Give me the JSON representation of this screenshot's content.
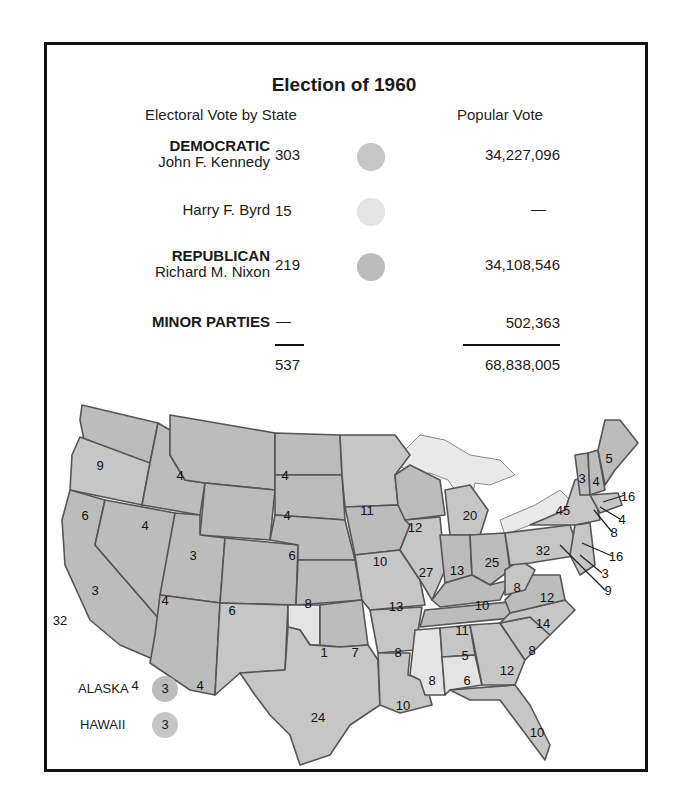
{
  "title": "Election of 1960",
  "subheaders": {
    "electoral": "Electoral Vote by State",
    "popular": "Popular Vote"
  },
  "colors": {
    "democratic": "#c6c6c6",
    "byrd": "#e4e4e4",
    "republican": "#bcbcbc",
    "border": "#555555",
    "water": "#e9e9e9"
  },
  "results": [
    {
      "party": "DEMOCRATIC",
      "candidate": "John F. Kennedy",
      "electoral": "303",
      "popular": "34,227,096"
    },
    {
      "party": "",
      "candidate": "Harry F. Byrd",
      "electoral": "15",
      "popular": "—"
    },
    {
      "party": "REPUBLICAN",
      "candidate": "Richard M. Nixon",
      "electoral": "219",
      "popular": "34,108,546"
    },
    {
      "party": "MINOR PARTIES",
      "candidate": "",
      "electoral": "—",
      "popular": "502,363"
    }
  ],
  "totals": {
    "electoral": "537",
    "popular": "68,838,005"
  },
  "legend": [
    {
      "label": "ALASKA",
      "votes": "3"
    },
    {
      "label": "HAWAII",
      "votes": "3"
    }
  ],
  "states": [
    {
      "id": "WA",
      "votes": "9",
      "x": 100,
      "y": 75
    },
    {
      "id": "OR",
      "votes": "6",
      "x": 85,
      "y": 125
    },
    {
      "id": "CA",
      "votes": "32",
      "x": 60,
      "y": 230
    },
    {
      "id": "NV",
      "votes": "3",
      "x": 95,
      "y": 200
    },
    {
      "id": "ID",
      "votes": "4",
      "x": 145,
      "y": 135
    },
    {
      "id": "MT",
      "votes": "4",
      "x": 180,
      "y": 85
    },
    {
      "id": "WY",
      "votes": "3",
      "x": 193,
      "y": 165
    },
    {
      "id": "UT",
      "votes": "4",
      "x": 165,
      "y": 210
    },
    {
      "id": "CO",
      "votes": "6",
      "x": 232,
      "y": 220
    },
    {
      "id": "AZ",
      "votes": "4",
      "x": 135,
      "y": 295
    },
    {
      "id": "NM",
      "votes": "4",
      "x": 200,
      "y": 295
    },
    {
      "id": "ND",
      "votes": "4",
      "x": 285,
      "y": 85
    },
    {
      "id": "SD",
      "votes": "4",
      "x": 287,
      "y": 125
    },
    {
      "id": "NE",
      "votes": "6",
      "x": 292,
      "y": 165
    },
    {
      "id": "KS",
      "votes": "8",
      "x": 308,
      "y": 213
    },
    {
      "id": "OK1",
      "votes": "1",
      "x": 324,
      "y": 262
    },
    {
      "id": "OK",
      "votes": "7",
      "x": 355,
      "y": 262
    },
    {
      "id": "TX",
      "votes": "24",
      "x": 318,
      "y": 327
    },
    {
      "id": "MN",
      "votes": "11",
      "x": 367,
      "y": 120
    },
    {
      "id": "IA",
      "votes": "10",
      "x": 380,
      "y": 171
    },
    {
      "id": "MO",
      "votes": "13",
      "x": 396,
      "y": 216
    },
    {
      "id": "AR",
      "votes": "8",
      "x": 398,
      "y": 262
    },
    {
      "id": "LA",
      "votes": "10",
      "x": 403,
      "y": 315
    },
    {
      "id": "WI",
      "votes": "12",
      "x": 415,
      "y": 137
    },
    {
      "id": "IL",
      "votes": "27",
      "x": 426,
      "y": 182
    },
    {
      "id": "MI",
      "votes": "20",
      "x": 470,
      "y": 125
    },
    {
      "id": "IN",
      "votes": "13",
      "x": 457,
      "y": 180
    },
    {
      "id": "OH",
      "votes": "25",
      "x": 492,
      "y": 172
    },
    {
      "id": "KY",
      "votes": "10",
      "x": 482,
      "y": 215
    },
    {
      "id": "TN",
      "votes": "11",
      "x": 462,
      "y": 240
    },
    {
      "id": "MS",
      "votes": "8",
      "x": 432,
      "y": 290
    },
    {
      "id": "AL5",
      "votes": "5",
      "x": 465,
      "y": 265
    },
    {
      "id": "AL",
      "votes": "6",
      "x": 467,
      "y": 290
    },
    {
      "id": "GA",
      "votes": "12",
      "x": 507,
      "y": 280
    },
    {
      "id": "FL",
      "votes": "10",
      "x": 537,
      "y": 342
    },
    {
      "id": "SC",
      "votes": "8",
      "x": 532,
      "y": 260
    },
    {
      "id": "NC",
      "votes": "14",
      "x": 543,
      "y": 233
    },
    {
      "id": "VA",
      "votes": "12",
      "x": 547,
      "y": 207
    },
    {
      "id": "WV",
      "votes": "8",
      "x": 517,
      "y": 197
    },
    {
      "id": "PA",
      "votes": "32",
      "x": 543,
      "y": 160
    },
    {
      "id": "NY",
      "votes": "45",
      "x": 563,
      "y": 120
    },
    {
      "id": "VT",
      "votes": "3",
      "x": 582,
      "y": 88
    },
    {
      "id": "NH",
      "votes": "4",
      "x": 596,
      "y": 91
    },
    {
      "id": "ME",
      "votes": "5",
      "x": 609,
      "y": 68
    }
  ],
  "callouts": [
    {
      "id": "MA",
      "votes": "16",
      "x": 628,
      "y": 106
    },
    {
      "id": "RI",
      "votes": "4",
      "x": 622,
      "y": 129
    },
    {
      "id": "CT",
      "votes": "8",
      "x": 614,
      "y": 142
    },
    {
      "id": "NJ",
      "votes": "16",
      "x": 616,
      "y": 166
    },
    {
      "id": "DE",
      "votes": "3",
      "x": 605,
      "y": 183
    },
    {
      "id": "MD",
      "votes": "9",
      "x": 608,
      "y": 200
    }
  ]
}
